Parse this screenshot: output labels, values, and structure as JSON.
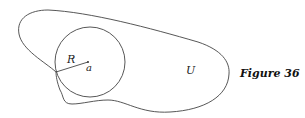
{
  "figure": {
    "caption": "Figure 36",
    "labels": {
      "radius": "R",
      "center": "a",
      "region": "U"
    },
    "stroke_color": "#444444"
  }
}
